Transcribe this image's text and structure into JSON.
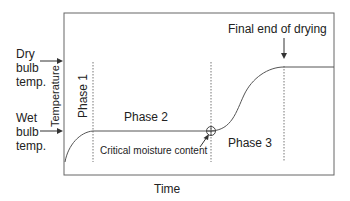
{
  "diagram": {
    "axes": {
      "x_label": "Time",
      "y_label": "Temperature"
    },
    "left_markers": {
      "dry_bulb": [
        "Dry",
        "bulb",
        "temp."
      ],
      "wet_bulb": [
        "Wet",
        "bulb",
        "temp."
      ]
    },
    "phases": {
      "phase1": "Phase 1",
      "phase2": "Phase 2",
      "phase3": "Phase 3"
    },
    "annotations": {
      "critical_moisture": "Critical moisture content",
      "final_end": "Final end of drying"
    },
    "colors": {
      "line": "#555555",
      "frame": "#666666",
      "text": "#222222"
    }
  }
}
